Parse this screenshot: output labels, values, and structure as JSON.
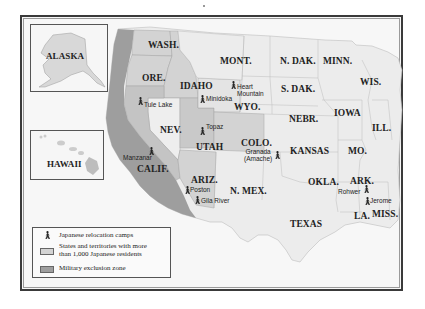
{
  "map": {
    "title": "Japanese American relocation during World War II",
    "colors": {
      "resident_states": "#d3d3d3",
      "exclusion_zone": "#9e9e9e",
      "other_states": "#ececec",
      "ocean": "#f7f7f7",
      "border": "#3a3a3a"
    },
    "insets": [
      {
        "name": "alaska",
        "label": "ALASKA"
      },
      {
        "name": "hawaii",
        "label": "HAWAII"
      }
    ],
    "states": [
      {
        "id": "wash",
        "label": "WASH."
      },
      {
        "id": "ore",
        "label": "ORE."
      },
      {
        "id": "idaho",
        "label": "IDAHO"
      },
      {
        "id": "mont",
        "label": "MONT."
      },
      {
        "id": "wyo",
        "label": "WYO."
      },
      {
        "id": "nev",
        "label": "NEV."
      },
      {
        "id": "utah",
        "label": "UTAH"
      },
      {
        "id": "colo",
        "label": "COLO."
      },
      {
        "id": "calif",
        "label": "CALIF."
      },
      {
        "id": "ariz",
        "label": "ARIZ."
      },
      {
        "id": "nmex",
        "label": "N. MEX."
      },
      {
        "id": "ndak",
        "label": "N. DAK."
      },
      {
        "id": "sdak",
        "label": "S. DAK."
      },
      {
        "id": "nebr",
        "label": "NEBR."
      },
      {
        "id": "kansas",
        "label": "KANSAS"
      },
      {
        "id": "okla",
        "label": "OKLA."
      },
      {
        "id": "texas",
        "label": "TEXAS"
      },
      {
        "id": "minn",
        "label": "MINN."
      },
      {
        "id": "iowa",
        "label": "IOWA"
      },
      {
        "id": "mo",
        "label": "MO."
      },
      {
        "id": "ark",
        "label": "ARK."
      },
      {
        "id": "la",
        "label": "LA."
      },
      {
        "id": "wis",
        "label": "WIS."
      },
      {
        "id": "ill",
        "label": "ILL."
      },
      {
        "id": "miss",
        "label": "MISS."
      }
    ],
    "camps": [
      {
        "id": "tule-lake",
        "label": "Tule Lake"
      },
      {
        "id": "minidoka",
        "label": "Minidoka"
      },
      {
        "id": "heart-mountain",
        "label": "Heart\nMountain"
      },
      {
        "id": "topaz",
        "label": "Topaz"
      },
      {
        "id": "manzanar",
        "label": "Manzanar"
      },
      {
        "id": "granada",
        "label": "Granada\n(Amache)"
      },
      {
        "id": "poston",
        "label": "Poston"
      },
      {
        "id": "gila-river",
        "label": "Gila River"
      },
      {
        "id": "rohwer",
        "label": "Rohwer"
      },
      {
        "id": "jerome",
        "label": "Jerome"
      }
    ]
  },
  "legend": {
    "items": [
      {
        "icon": "relocation-camp-icon",
        "label": "Japanese relocation camps"
      },
      {
        "icon": "light-gray-swatch",
        "label": "States and territories with more than 1,000 Japanese residents",
        "line1": "States and territories with more",
        "line2": "than 1,000 Japanese residents"
      },
      {
        "icon": "dark-gray-swatch",
        "label": "Military exclusion zone"
      }
    ]
  }
}
